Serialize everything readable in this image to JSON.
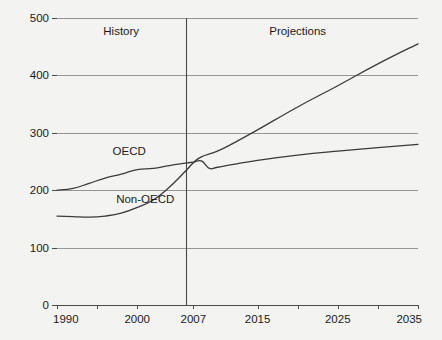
{
  "chart_data": {
    "type": "line",
    "title": "",
    "subtitle": "",
    "xlabel": "",
    "ylabel": "",
    "xlim": [
      1990,
      2035
    ],
    "ylim": [
      0,
      500
    ],
    "grid": true,
    "legend_position": "inline-annotation",
    "y_ticks": [
      0,
      100,
      200,
      300,
      400,
      500
    ],
    "y_tick_labels": [
      "0",
      "100",
      "200",
      "300",
      "400",
      "500"
    ],
    "x_ticks": [
      1990,
      1995,
      2000,
      2007,
      2015,
      2020,
      2025,
      2030,
      2035
    ],
    "x_tick_labels": [
      "1990",
      "",
      "2000",
      "2007",
      "2015",
      "",
      "2025",
      "",
      "2035"
    ],
    "x_labeled_ticks": [
      1990,
      2000,
      2007,
      2015,
      2025,
      2035
    ],
    "divider_x": 2007,
    "annotations": [
      {
        "text": "History",
        "x": 1998,
        "y": 470
      },
      {
        "text": "Projections",
        "x": 2020,
        "y": 470
      },
      {
        "text": "OECD",
        "x": 1999,
        "y": 262
      },
      {
        "text": "Non-OECD",
        "x": 2001,
        "y": 178
      }
    ],
    "series": [
      {
        "name": "OECD",
        "color": "#3b3b3b",
        "x": [
          1990,
          1992,
          1994,
          1996,
          1998,
          2000,
          2002,
          2004,
          2006,
          2007,
          2008,
          2009,
          2010,
          2012,
          2015,
          2020,
          2025,
          2030,
          2035
        ],
        "values": [
          200,
          203,
          212,
          221,
          228,
          236,
          238,
          243,
          247,
          249,
          251,
          238,
          240,
          245,
          252,
          261,
          268,
          274,
          280
        ]
      },
      {
        "name": "Non-OECD",
        "color": "#3b3b3b",
        "x": [
          1990,
          1992,
          1994,
          1996,
          1998,
          2000,
          2002,
          2004,
          2006,
          2007,
          2008,
          2010,
          2012,
          2015,
          2020,
          2025,
          2030,
          2035
        ],
        "values": [
          155,
          154,
          153,
          155,
          160,
          170,
          183,
          205,
          233,
          248,
          258,
          268,
          282,
          305,
          345,
          382,
          420,
          455
        ]
      }
    ]
  },
  "axis": {
    "y_labels": [
      "500",
      "400",
      "300",
      "200",
      "100",
      "0"
    ],
    "x_labels": [
      "1990",
      "2000",
      "2007",
      "2015",
      "2025",
      "2035"
    ]
  },
  "labels": {
    "history": "History",
    "projections": "Projections",
    "oecd": "OECD",
    "non_oecd": "Non-OECD"
  },
  "colors": {
    "background": "#f3f3f1",
    "line": "#3b3b3b",
    "grid": "#8c8c8c",
    "axis": "#4a4a4a",
    "text": "#1a1a1a"
  }
}
